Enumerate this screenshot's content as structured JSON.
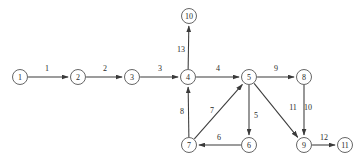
{
  "diagram": {
    "background_color": "#ffffff",
    "node_stroke_color": "#555555",
    "edge_stroke_color": "#3a3a3a",
    "text_color": "#2a2a2a"
  },
  "chart_data": {
    "type": "diagram",
    "nodes": [
      {
        "id": "1",
        "label": "1",
        "x": 20,
        "y": 77
      },
      {
        "id": "2",
        "label": "2",
        "x": 78,
        "y": 77
      },
      {
        "id": "3",
        "label": "3",
        "x": 132,
        "y": 77
      },
      {
        "id": "4",
        "label": "4",
        "x": 188,
        "y": 77
      },
      {
        "id": "5",
        "label": "5",
        "x": 249,
        "y": 77
      },
      {
        "id": "6",
        "label": "6",
        "x": 249,
        "y": 145
      },
      {
        "id": "7",
        "label": "7",
        "x": 189,
        "y": 145
      },
      {
        "id": "8",
        "label": "8",
        "x": 304,
        "y": 77
      },
      {
        "id": "9",
        "label": "9",
        "x": 304,
        "y": 145
      },
      {
        "id": "10",
        "label": "10",
        "x": 189,
        "y": 16
      },
      {
        "id": "11",
        "label": "11",
        "x": 345,
        "y": 145
      }
    ],
    "node_radius": 7.5,
    "edges": [
      {
        "from": "1",
        "to": "2",
        "label": "1",
        "label_x": 47,
        "label_y": 68,
        "directed": true
      },
      {
        "from": "2",
        "to": "3",
        "label": "2",
        "label_x": 105,
        "label_y": 68,
        "directed": true
      },
      {
        "from": "3",
        "to": "4",
        "label": "3",
        "label_x": 160,
        "label_y": 68,
        "directed": true
      },
      {
        "from": "4",
        "to": "5",
        "label": "4",
        "label_x": 218,
        "label_y": 68,
        "directed": true
      },
      {
        "from": "5",
        "to": "8",
        "label": "9",
        "label_x": 276,
        "label_y": 68,
        "directed": true
      },
      {
        "from": "4",
        "to": "10",
        "label": "13",
        "label_x": 181,
        "label_y": 49,
        "directed": true
      },
      {
        "from": "7",
        "to": "4",
        "label": "8",
        "label_x": 182,
        "label_y": 111,
        "directed": true
      },
      {
        "from": "7",
        "to": "5",
        "label": "7",
        "label_x": 212,
        "label_y": 110,
        "directed": true
      },
      {
        "from": "5",
        "to": "6",
        "label": "5",
        "label_x": 256,
        "label_y": 115,
        "directed": true
      },
      {
        "from": "6",
        "to": "7",
        "label": "6",
        "label_x": 219,
        "label_y": 137,
        "directed": true
      },
      {
        "from": "5",
        "to": "9",
        "label": "11",
        "label_x": 293,
        "label_y": 107,
        "directed": true
      },
      {
        "from": "8",
        "to": "9",
        "label": "10",
        "label_x": 308,
        "label_y": 107,
        "directed": true
      },
      {
        "from": "9",
        "to": "11",
        "label": "12",
        "label_x": 324,
        "label_y": 137,
        "directed": true
      }
    ]
  }
}
